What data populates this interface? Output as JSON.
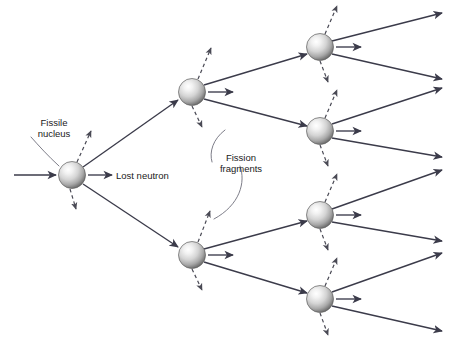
{
  "diagram": {
    "type": "branching-chain-reaction",
    "canvas": {
      "width": 449,
      "height": 340,
      "background": "#ffffff"
    },
    "colors": {
      "line": "#3b3b4a",
      "dashed_line": "#4a4a55",
      "leader_line": "#6e6e7a",
      "text": "#1a1a1a",
      "nucleus_light": "#ffffff",
      "nucleus_mid": "#c9c9c9",
      "nucleus_dark": "#6d6d6d"
    },
    "labels": {
      "fissile_nucleus": "Fissile\nnucleus",
      "fissile_nucleus_line1": "Fissile",
      "fissile_nucleus_line2": "nucleus",
      "lost_neutron": "Lost neutron",
      "fission_fragments_line1": "Fission",
      "fission_fragments_line2": "fragments"
    },
    "nuclei": [
      {
        "id": "nucleus-gen1",
        "generation": 1,
        "cx": 72,
        "cy": 175,
        "r": 13.5
      },
      {
        "id": "nucleus-gen2-upper",
        "generation": 2,
        "cx": 192,
        "cy": 92,
        "r": 13.5
      },
      {
        "id": "nucleus-gen2-lower",
        "generation": 2,
        "cx": 192,
        "cy": 255,
        "r": 13.5
      },
      {
        "id": "nucleus-gen3-1",
        "generation": 3,
        "cx": 320,
        "cy": 47,
        "r": 13.5
      },
      {
        "id": "nucleus-gen3-2",
        "generation": 3,
        "cx": 320,
        "cy": 131,
        "r": 13.5
      },
      {
        "id": "nucleus-gen3-3",
        "generation": 3,
        "cx": 320,
        "cy": 215,
        "r": 13.5
      },
      {
        "id": "nucleus-gen3-4",
        "generation": 3,
        "cx": 320,
        "cy": 299,
        "r": 13.5
      }
    ],
    "neutron_paths": [
      {
        "id": "incoming-neutron",
        "kind": "solid",
        "x1": 14,
        "y1": 175,
        "x2": 56,
        "y2": 175
      },
      {
        "id": "gen1-to-gen2-upper",
        "kind": "solid",
        "x1": 83,
        "y1": 167,
        "x2": 178,
        "y2": 100
      },
      {
        "id": "gen1-to-gen2-lower",
        "kind": "solid",
        "x1": 83,
        "y1": 184,
        "x2": 178,
        "y2": 247
      },
      {
        "id": "gen2-upper-to-gen3-1",
        "kind": "solid",
        "x1": 204,
        "y1": 85,
        "x2": 307,
        "y2": 54
      },
      {
        "id": "gen2-upper-to-gen3-2",
        "kind": "solid",
        "x1": 204,
        "y1": 99,
        "x2": 307,
        "y2": 126
      },
      {
        "id": "gen2-lower-to-gen3-3",
        "kind": "solid",
        "x1": 204,
        "y1": 249,
        "x2": 307,
        "y2": 221
      },
      {
        "id": "gen2-lower-to-gen3-4",
        "kind": "solid",
        "x1": 204,
        "y1": 262,
        "x2": 307,
        "y2": 293
      },
      {
        "id": "gen3-1-out-upper",
        "kind": "solid",
        "x1": 332,
        "y1": 41,
        "x2": 442,
        "y2": 13
      },
      {
        "id": "gen3-1-out-lower",
        "kind": "solid",
        "x1": 332,
        "y1": 54,
        "x2": 442,
        "y2": 79
      },
      {
        "id": "gen3-2-out-upper",
        "kind": "solid",
        "x1": 332,
        "y1": 124,
        "x2": 442,
        "y2": 88
      },
      {
        "id": "gen3-2-out-lower",
        "kind": "solid",
        "x1": 332,
        "y1": 138,
        "x2": 442,
        "y2": 157
      },
      {
        "id": "gen3-3-out-upper",
        "kind": "solid",
        "x1": 332,
        "y1": 209,
        "x2": 442,
        "y2": 170
      },
      {
        "id": "gen3-3-out-lower",
        "kind": "solid",
        "x1": 332,
        "y1": 222,
        "x2": 442,
        "y2": 241
      },
      {
        "id": "gen3-4-out-upper",
        "kind": "solid",
        "x1": 332,
        "y1": 292,
        "x2": 442,
        "y2": 253
      },
      {
        "id": "gen3-4-out-lower",
        "kind": "solid",
        "x1": 332,
        "y1": 306,
        "x2": 442,
        "y2": 331
      }
    ],
    "lost_neutrons": [
      {
        "id": "lost-neutron-gen1",
        "x1": 88,
        "y1": 175,
        "x2": 112,
        "y2": 175
      },
      {
        "id": "lost-neutron-gen2-upper",
        "x1": 208,
        "y1": 92,
        "x2": 233,
        "y2": 92
      },
      {
        "id": "lost-neutron-gen2-lower",
        "x1": 208,
        "y1": 255,
        "x2": 233,
        "y2": 255
      },
      {
        "id": "lost-neutron-gen3-1",
        "x1": 336,
        "y1": 47,
        "x2": 361,
        "y2": 47
      },
      {
        "id": "lost-neutron-gen3-2",
        "x1": 336,
        "y1": 131,
        "x2": 361,
        "y2": 131
      },
      {
        "id": "lost-neutron-gen3-3",
        "x1": 336,
        "y1": 215,
        "x2": 361,
        "y2": 215
      },
      {
        "id": "lost-neutron-gen3-4",
        "x1": 336,
        "y1": 299,
        "x2": 361,
        "y2": 299
      }
    ],
    "fission_fragments": [
      {
        "id": "fragment-gen1-up",
        "x1": 77,
        "y1": 162,
        "x2": 91,
        "y2": 131
      },
      {
        "id": "fragment-gen1-down",
        "x1": 70,
        "y1": 189,
        "x2": 76,
        "y2": 209
      },
      {
        "id": "fragment-gen2-upper-up",
        "x1": 198,
        "y1": 79,
        "x2": 211,
        "y2": 48
      },
      {
        "id": "fragment-gen2-upper-down",
        "x1": 192,
        "y1": 106,
        "x2": 202,
        "y2": 127
      },
      {
        "id": "fragment-gen2-lower-up",
        "x1": 198,
        "y1": 242,
        "x2": 210,
        "y2": 211
      },
      {
        "id": "fragment-gen2-lower-down",
        "x1": 192,
        "y1": 269,
        "x2": 202,
        "y2": 290
      },
      {
        "id": "fragment-gen3-1-up",
        "x1": 325,
        "y1": 34,
        "x2": 337,
        "y2": 6
      },
      {
        "id": "fragment-gen3-1-down",
        "x1": 320,
        "y1": 61,
        "x2": 328,
        "y2": 82
      },
      {
        "id": "fragment-gen3-2-up",
        "x1": 325,
        "y1": 118,
        "x2": 337,
        "y2": 90
      },
      {
        "id": "fragment-gen3-2-down",
        "x1": 320,
        "y1": 145,
        "x2": 328,
        "y2": 166
      },
      {
        "id": "fragment-gen3-3-up",
        "x1": 325,
        "y1": 202,
        "x2": 337,
        "y2": 174
      },
      {
        "id": "fragment-gen3-3-down",
        "x1": 320,
        "y1": 229,
        "x2": 328,
        "y2": 250
      },
      {
        "id": "fragment-gen3-4-up",
        "x1": 325,
        "y1": 286,
        "x2": 337,
        "y2": 258
      },
      {
        "id": "fragment-gen3-4-down",
        "x1": 320,
        "y1": 313,
        "x2": 328,
        "y2": 335
      }
    ],
    "leader_lines": [
      {
        "id": "leader-fissile-nucleus",
        "path": "M 31 137 C 39 146, 48 156, 59 166"
      },
      {
        "id": "leader-fission-upper",
        "path": "M 225 130 C 213 139, 209 152, 212 162"
      },
      {
        "id": "leader-fission-lower",
        "path": "M 240 166 C 246 182, 240 205, 214 219"
      }
    ],
    "text_positions": {
      "fissile_nucleus": {
        "x": 54,
        "y": 126,
        "anchor": "middle",
        "line_height": 11
      },
      "lost_neutron": {
        "x": 116,
        "y": 179,
        "anchor": "start"
      },
      "fission_fragments": {
        "x": 241,
        "y": 161,
        "anchor": "middle",
        "line_height": 11
      }
    }
  }
}
